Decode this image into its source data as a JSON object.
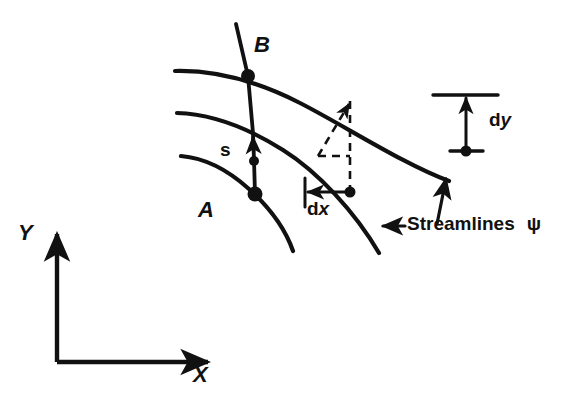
{
  "figure": {
    "kind": "streamline-diagram",
    "background_color": "#ffffff",
    "ink_color": "#111111"
  },
  "labels": {
    "point_b": "B",
    "point_a": "A",
    "arc_length": "s",
    "dx_d": "d",
    "dx_var": "x",
    "dy_d": "d",
    "dy_var": "y",
    "axis_y": "Y",
    "axis_x": "X",
    "streamlines": "Streamlines",
    "stream_function": "ψ"
  },
  "annotations": {
    "dx_label": "dx",
    "dy_label": "dy",
    "streamlines_label": "Streamlines ψ"
  },
  "elements": {
    "streamline_upper": "upper streamline through point B",
    "streamline_middle": "middle streamline through dx-dy corner point",
    "streamline_lower": "lower streamline through point A",
    "s_line": "line s from A to B crossing the streamlines",
    "dashed_triangle": "dashed right triangle showing ds, dx and dy components",
    "dx_dimension": "horizontal dx dimension with tick and arrow",
    "dy_dimension": "vertical dy dimension with ticks and arrow",
    "leader_upper": "leader arrow pointing to upper-right streamline",
    "leader_lower": "leader arrow pointing to lower streamline",
    "axes": "X and Y coordinate axes with arrowheads"
  }
}
